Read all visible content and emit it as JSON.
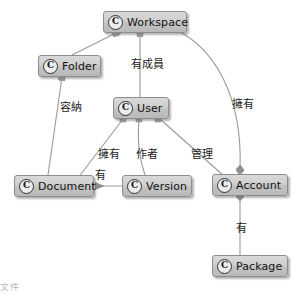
{
  "diagram": {
    "type": "uml-class-relationship-diagram",
    "icon_letter": "C",
    "node_fill": "#cccccc",
    "node_border": "#8d8d8d",
    "edge_color": "#9a9a9a",
    "text_color": "#121212",
    "nodes": [
      {
        "id": "workspace",
        "label": "Workspace",
        "x": 103,
        "y": 11,
        "w": 84
      },
      {
        "id": "folder",
        "label": "Folder",
        "x": 38,
        "y": 55,
        "w": 63
      },
      {
        "id": "user",
        "label": "User",
        "x": 113,
        "y": 97,
        "w": 56
      },
      {
        "id": "document",
        "label": "Document",
        "x": 14,
        "y": 175,
        "w": 80
      },
      {
        "id": "version",
        "label": "Version",
        "x": 122,
        "y": 175,
        "w": 70
      },
      {
        "id": "account",
        "label": "Account",
        "x": 212,
        "y": 174,
        "w": 76
      },
      {
        "id": "package",
        "label": "Package",
        "x": 212,
        "y": 255,
        "w": 76
      }
    ],
    "edges": [
      {
        "id": "workspace-folder",
        "from": "workspace",
        "to": "folder",
        "label": ""
      },
      {
        "id": "workspace-user",
        "from": "workspace",
        "to": "user",
        "label": "有成員"
      },
      {
        "id": "workspace-account",
        "from": "workspace",
        "to": "account",
        "label": "擁有"
      },
      {
        "id": "folder-document",
        "from": "folder",
        "to": "document",
        "label": "容納"
      },
      {
        "id": "user-document",
        "from": "user",
        "to": "document",
        "label": "擁有"
      },
      {
        "id": "user-version",
        "from": "user",
        "to": "version",
        "label": "作者"
      },
      {
        "id": "user-account",
        "from": "user",
        "to": "account",
        "label": "管理"
      },
      {
        "id": "version-document",
        "from": "version",
        "to": "document",
        "label": "有"
      },
      {
        "id": "account-package",
        "from": "account",
        "to": "package",
        "label": "有"
      }
    ],
    "edge_labels": [
      {
        "id": "label-has-member",
        "text": "有成員",
        "x": 131,
        "y": 55
      },
      {
        "id": "label-owns-account",
        "text": "擁有",
        "x": 232,
        "y": 95
      },
      {
        "id": "label-contains",
        "text": "容納",
        "x": 60,
        "y": 98
      },
      {
        "id": "label-owns-document",
        "text": "擁有",
        "x": 98,
        "y": 145
      },
      {
        "id": "label-author",
        "text": "作者",
        "x": 136,
        "y": 145
      },
      {
        "id": "label-manages",
        "text": "管理",
        "x": 191,
        "y": 145
      },
      {
        "id": "label-has-version",
        "text": "有",
        "x": 95,
        "y": 166
      },
      {
        "id": "label-has-package",
        "text": "有",
        "x": 236,
        "y": 219
      }
    ],
    "corner_artifact": "文件"
  }
}
